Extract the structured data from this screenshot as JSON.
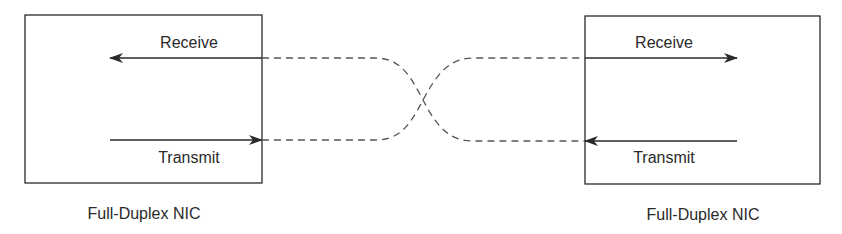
{
  "diagram": {
    "left_nic": {
      "caption": "Full-Duplex NIC",
      "receive_label": "Receive",
      "transmit_label": "Transmit"
    },
    "right_nic": {
      "caption": "Full-Duplex NIC",
      "receive_label": "Receive",
      "transmit_label": "Transmit"
    },
    "colors": {
      "line": "#2a2a2a",
      "dashed": "#555555",
      "background": "#ffffff"
    }
  }
}
